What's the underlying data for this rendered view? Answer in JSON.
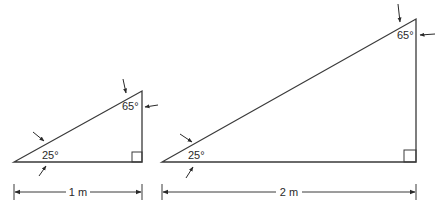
{
  "diagram": {
    "colors": {
      "stroke": "#3a3a3a",
      "text": "#2a2a2a",
      "background": "#ffffff"
    },
    "triangles": [
      {
        "name": "small-triangle",
        "vertices": {
          "bottom_left": [
            14,
            162
          ],
          "bottom_right": [
            142,
            162
          ],
          "top": [
            142,
            91
          ]
        },
        "angle_bottom_left": "25°",
        "angle_top": "65°",
        "right_angle_box": 10,
        "base_label": "1 m",
        "dimension": {
          "x1": 14,
          "x2": 142,
          "y": 192
        }
      },
      {
        "name": "large-triangle",
        "vertices": {
          "bottom_left": [
            162,
            162
          ],
          "bottom_right": [
            416,
            162
          ],
          "top": [
            416,
            19
          ]
        },
        "angle_bottom_left": "25°",
        "angle_top": "65°",
        "right_angle_box": 12,
        "base_label": "2 m",
        "dimension": {
          "x1": 162,
          "x2": 416,
          "y": 192
        }
      }
    ]
  }
}
